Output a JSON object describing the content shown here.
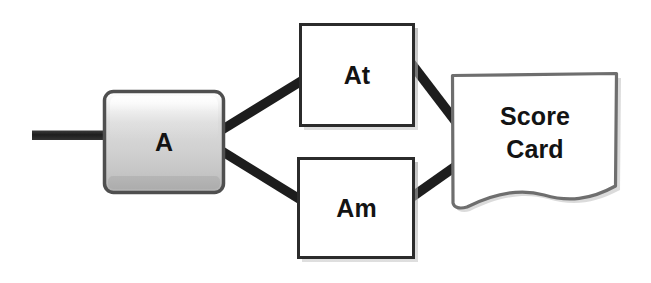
{
  "diagram": {
    "type": "flowchart",
    "background_color": "#ffffff",
    "stroke_color": "#1a1a1a",
    "nodes": [
      {
        "id": "input-stub",
        "shape": "line-stub",
        "label": "",
        "x": 32,
        "y": 131,
        "w": 72,
        "h": 9,
        "fill": "#262626",
        "interactable": false
      },
      {
        "id": "a",
        "shape": "rounded-rectangle-3d",
        "label": "A",
        "x": 104,
        "y": 91,
        "w": 120,
        "h": 102,
        "fill_light": "#f2f2f2",
        "fill_mid": "#d8d8d8",
        "fill_dark": "#a9a9a9",
        "border": "#4a4a4a"
      },
      {
        "id": "at",
        "shape": "rectangle",
        "label": "At",
        "x": 300,
        "y": 24,
        "w": 114,
        "h": 102,
        "fill": "#ffffff",
        "border": "#2b2b2b"
      },
      {
        "id": "am",
        "shape": "rectangle",
        "label": "Am",
        "x": 298,
        "y": 158,
        "w": 117,
        "h": 100,
        "fill": "#ffffff",
        "border": "#2b2b2b"
      },
      {
        "id": "score-card",
        "shape": "document",
        "label": "Score\nCard",
        "label_line_1": "Score",
        "label_line_2": "Card",
        "x": 452,
        "y": 74,
        "w": 165,
        "h": 131,
        "fill": "#ffffff",
        "border": "#6b6b6b"
      }
    ],
    "edges": [
      {
        "id": "edge-input-a",
        "from": "input-stub",
        "to": "a",
        "label": ""
      },
      {
        "id": "edge-a-at",
        "from": "a",
        "to": "at",
        "label": ""
      },
      {
        "id": "edge-a-am",
        "from": "a",
        "to": "am",
        "label": ""
      },
      {
        "id": "edge-at-score",
        "from": "at",
        "to": "score-card",
        "label": ""
      },
      {
        "id": "edge-am-score",
        "from": "am",
        "to": "score-card",
        "label": ""
      }
    ]
  }
}
